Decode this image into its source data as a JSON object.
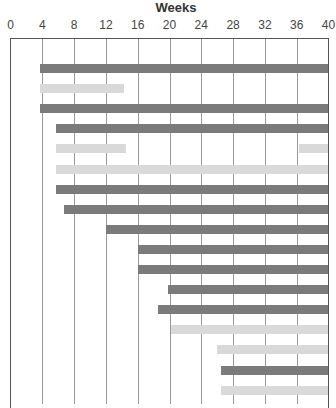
{
  "chart_data": {
    "type": "gantt",
    "title": "Weeks",
    "xlabel": "Weeks",
    "xlim": [
      0,
      40
    ],
    "x_ticks": [
      0,
      4,
      8,
      12,
      16,
      20,
      24,
      28,
      32,
      36,
      40
    ],
    "grid": true,
    "colors": {
      "dark": "#7b7b7b",
      "light": "#d9d9d9",
      "grid": "#9a9a9a"
    },
    "tasks": [
      {
        "row": 1,
        "style": "dark",
        "segments": [
          [
            3.75,
            40
          ]
        ]
      },
      {
        "row": 2,
        "style": "light",
        "segments": [
          [
            3.75,
            14.25
          ]
        ]
      },
      {
        "row": 3,
        "style": "dark",
        "segments": [
          [
            3.75,
            40
          ]
        ]
      },
      {
        "row": 4,
        "style": "dark",
        "segments": [
          [
            5.75,
            40
          ]
        ]
      },
      {
        "row": 5,
        "style": "light",
        "segments": [
          [
            5.75,
            14.5
          ],
          [
            36.25,
            40
          ]
        ]
      },
      {
        "row": 6,
        "style": "light",
        "segments": [
          [
            5.75,
            40
          ]
        ]
      },
      {
        "row": 7,
        "style": "dark",
        "segments": [
          [
            5.75,
            40
          ]
        ]
      },
      {
        "row": 8,
        "style": "dark",
        "segments": [
          [
            6.75,
            40
          ]
        ]
      },
      {
        "row": 9,
        "style": "dark",
        "segments": [
          [
            12,
            40
          ]
        ]
      },
      {
        "row": 10,
        "style": "dark",
        "segments": [
          [
            16,
            40
          ]
        ]
      },
      {
        "row": 11,
        "style": "dark",
        "segments": [
          [
            16,
            40
          ]
        ]
      },
      {
        "row": 12,
        "style": "dark",
        "segments": [
          [
            19.75,
            40
          ]
        ]
      },
      {
        "row": 13,
        "style": "dark",
        "segments": [
          [
            18.5,
            40
          ]
        ]
      },
      {
        "row": 14,
        "style": "light",
        "segments": [
          [
            20.25,
            40
          ]
        ]
      },
      {
        "row": 15,
        "style": "light",
        "segments": [
          [
            26,
            40
          ]
        ]
      },
      {
        "row": 16,
        "style": "dark",
        "segments": [
          [
            26.5,
            40
          ]
        ]
      },
      {
        "row": 17,
        "style": "light",
        "segments": [
          [
            26.5,
            40
          ]
        ]
      }
    ]
  }
}
